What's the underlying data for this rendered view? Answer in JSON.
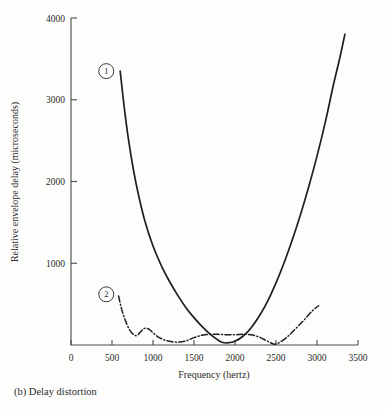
{
  "caption": "(b) Delay distortion",
  "chart_data": {
    "type": "line",
    "title": "",
    "xlabel": "Frequency (hertz)",
    "ylabel": "Relative envelope delay (microseconds)",
    "xlim": [
      0,
      3500
    ],
    "ylim": [
      0,
      4000
    ],
    "xticks": [
      0,
      500,
      1000,
      1500,
      2000,
      2500,
      3000,
      3500
    ],
    "xticklabels": [
      "0",
      "500",
      "1000",
      "1500",
      "2000",
      "2500",
      "3000",
      "3500"
    ],
    "yticks": [
      1000,
      2000,
      3000,
      4000
    ],
    "yticklabels": [
      "1000",
      "2000",
      "3000",
      "4000"
    ],
    "grid": false,
    "legend": "inline-numbered-markers",
    "annotations": [
      {
        "label": "1",
        "x": 430,
        "y": 3350,
        "style": "circled"
      },
      {
        "label": "2",
        "x": 430,
        "y": 620,
        "style": "circled"
      }
    ],
    "series": [
      {
        "name": "1",
        "style": "solid",
        "x": [
          600,
          650,
          700,
          760,
          820,
          900,
          1000,
          1100,
          1200,
          1300,
          1400,
          1500,
          1600,
          1700,
          1800,
          1850,
          1900,
          2000,
          2100,
          2200,
          2300,
          2400,
          2500,
          2600,
          2700,
          2800,
          2900,
          3000,
          3100,
          3200,
          3280,
          3340
        ],
        "y": [
          3350,
          2900,
          2520,
          2150,
          1850,
          1520,
          1210,
          975,
          780,
          610,
          460,
          335,
          225,
          130,
          55,
          30,
          25,
          45,
          110,
          215,
          360,
          540,
          760,
          1010,
          1290,
          1600,
          1940,
          2310,
          2720,
          3180,
          3520,
          3800
        ]
      },
      {
        "name": "2",
        "style": "dash-dot",
        "x": [
          580,
          620,
          680,
          740,
          800,
          860,
          900,
          950,
          1000,
          1060,
          1120,
          1200,
          1300,
          1400,
          1500,
          1600,
          1700,
          1800,
          1900,
          2000,
          2100,
          2200,
          2300,
          2400,
          2480,
          2550,
          2650,
          2750,
          2850,
          2950,
          3020
        ],
        "y": [
          600,
          430,
          255,
          150,
          115,
          175,
          205,
          195,
          150,
          100,
          70,
          45,
          35,
          50,
          90,
          120,
          130,
          130,
          125,
          125,
          130,
          125,
          95,
          45,
          10,
          35,
          110,
          210,
          315,
          425,
          480
        ]
      }
    ]
  }
}
